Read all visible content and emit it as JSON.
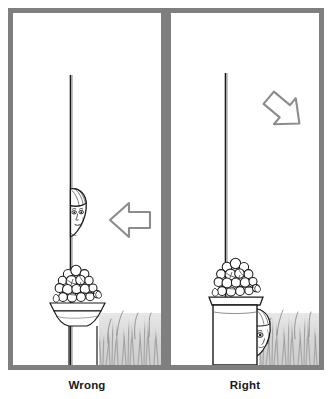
{
  "figure": {
    "type": "illustration-comparison",
    "frame_color": "#7f7f7f",
    "ink_color": "#1a1a1a",
    "ground_shade_color": "#d8d8d8",
    "background_color": "#ffffff"
  },
  "panels": [
    {
      "id": "panel-wrong",
      "caption": "Wrong",
      "elements": {
        "post_label": "vertical-post",
        "person_label": "head-peeking-beside-post",
        "planter_label": "pedestal-planter-with-flowers",
        "grass_label": "grass",
        "arrow_label": "left-pointing-arrow",
        "arrow_direction": "left",
        "arrow_color": "#8c8c8c"
      }
    },
    {
      "id": "panel-right",
      "caption": "Right",
      "elements": {
        "post_label": "vertical-post",
        "person_label": "head-hidden-low-behind-planter",
        "planter_label": "box-planter-with-flowers",
        "grass_label": "grass",
        "arrow_label": "down-left-pointing-arrow",
        "arrow_direction": "down-left",
        "arrow_color": "#8c8c8c"
      }
    }
  ],
  "captions": {
    "left": "Wrong",
    "right": "Right"
  }
}
